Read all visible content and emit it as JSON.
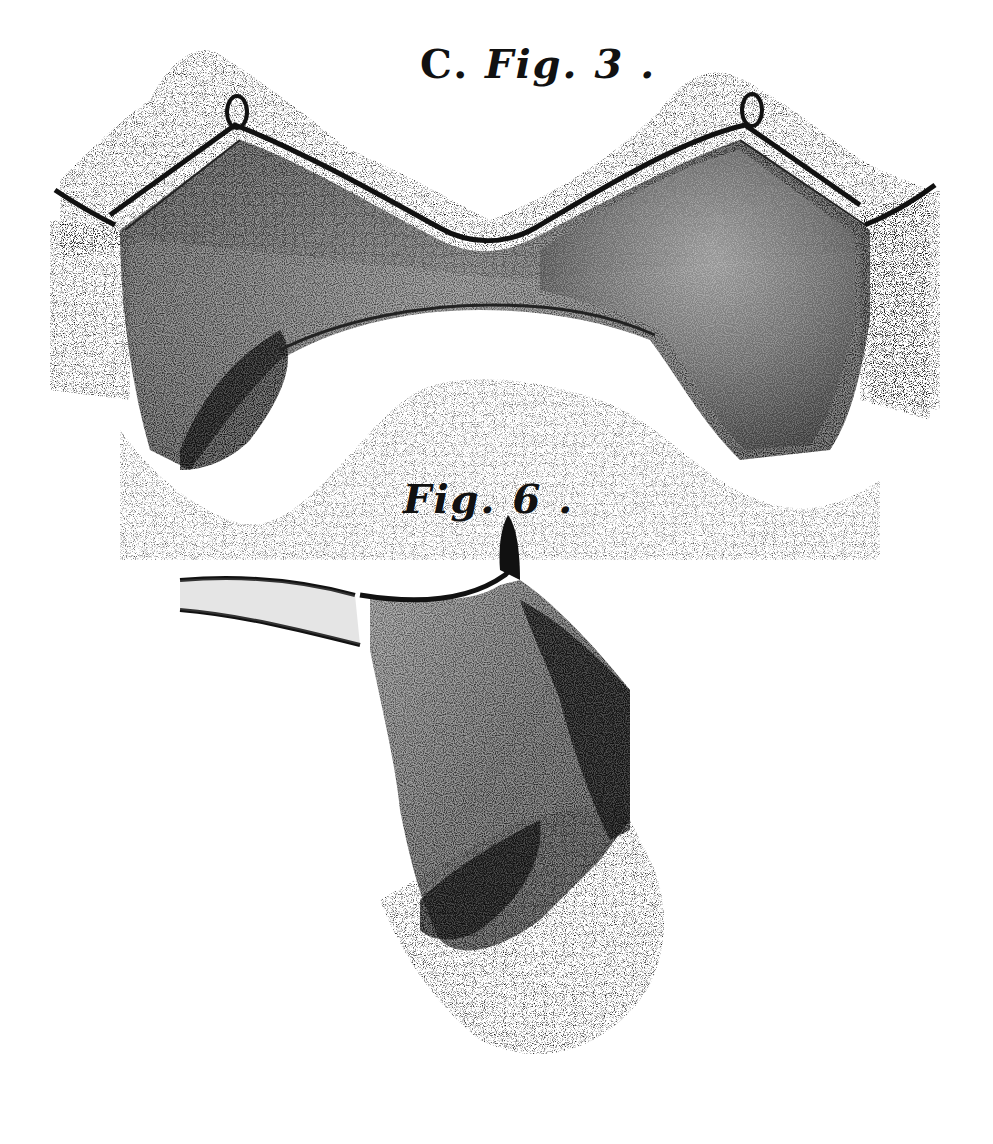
{
  "plate": {
    "figures": [
      {
        "id": "fig3",
        "prefix": "C.",
        "label": "Fig. 3 .",
        "description": "Stippled engraving of a bilobed, saddle-shaped chitinous plate with fringe of setae below and membranous tissue above"
      },
      {
        "id": "fig6",
        "label": "Fig. 6 .",
        "description": "Stippled engraving of a lateral view of the plate with two long slender processes and a setose base"
      }
    ],
    "colors": {
      "background": "#ffffff",
      "ink": "#111111",
      "mid_tone": "#555555",
      "light_tone": "#bbbbbb"
    }
  }
}
